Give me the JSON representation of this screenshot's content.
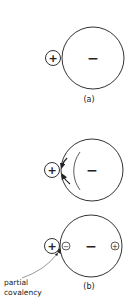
{
  "diagram": {
    "panel_a": {
      "cation_sign": "+",
      "anion_sign": "−",
      "caption": "(a)"
    },
    "panel_middle": {
      "cation_sign": "+",
      "anion_sign": "−"
    },
    "panel_b": {
      "cation_sign": "+",
      "anion_sign": "−",
      "induced_negative": "−",
      "induced_positive": "+",
      "caption": "(b)",
      "annotation_line1": "partial",
      "annotation_line2": "covalency"
    }
  }
}
